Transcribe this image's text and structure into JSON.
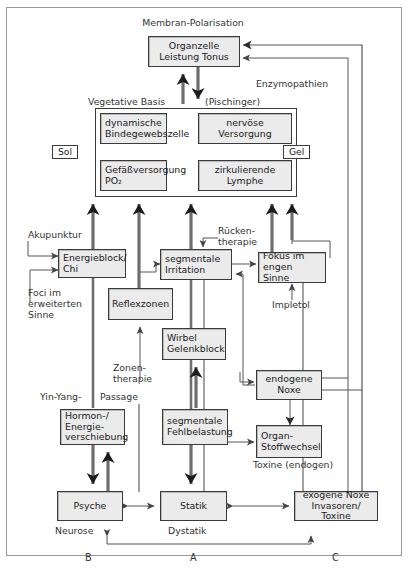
{
  "diagram": {
    "title_note": "Membran-Polarisation",
    "boxes": {
      "organzelle": "Organzelle\nLeistung Tonus",
      "dyn_binde": "dynamische\nBindegewebszelle",
      "nervoese": "nervöse\nVersorgung",
      "gefaess": "Gefäßversorgung\nPO₂",
      "zirk_lymphe": "zirkulierende\nLymphe",
      "energieblock": "Energieblock/\nChi",
      "segm_irritation": "segmentale\nIrritation",
      "fokus": "Fokus im\nengen Sinne",
      "reflexzonen": "Reflexzonen",
      "wirbel": "Wirbel\nGelenkblock",
      "endogene_noxe": "endogene\nNoxe",
      "hormon": "Hormon-/\nEnergie-\nverschiebung",
      "segm_fehl": "segmentale\nFehlbelastung",
      "organ_stoffwechsel": "Organ-\nStoffwechsel",
      "psyche": "Psyche",
      "statik": "Statik",
      "exogene_noxe": "exogene Noxe\nInvasoren/ Toxine"
    },
    "tags": {
      "sol": "Sol",
      "gel": "Gel"
    },
    "labels": {
      "membran": "Membran-Polarisation",
      "enzymopathien": "Enzymopathien",
      "vegetative_basis": "Vegetative Basis",
      "pischinger": "(Pischinger)",
      "akupunktur": "Akupunktur",
      "foci": "Foci im\nerweiterten\nSinne",
      "ruecken": "Rücken-\ntherapie",
      "impletol": "Impletol",
      "zonen": "Zonen-\ntherapie",
      "yinyang": "Yin-Yang-",
      "passage": "Passage",
      "toxine_endogen": "Toxine (endogen)",
      "neurose": "Neurose",
      "dystatik": "Dystatik",
      "letter_b": "B",
      "letter_a": "A",
      "letter_c": "C"
    },
    "colors": {
      "box_fill": "#ebebeb",
      "box_border": "#3a3a3a",
      "frame_border": "#9a9a9a",
      "line": "#555555",
      "thick_line": "#6e6e6e",
      "text": "#1a1a1a",
      "label_text": "#333333",
      "page_bg": "#ffffff"
    }
  }
}
